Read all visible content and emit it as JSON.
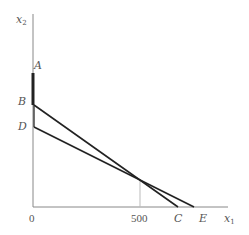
{
  "diagram": {
    "axes": {
      "y_label": "x",
      "y_label_sub": "2",
      "x_label": "x",
      "x_label_sub": "1",
      "origin_label": "0"
    },
    "points": {
      "A": "A",
      "B": "B",
      "C": "C",
      "D": "D",
      "E": "E"
    },
    "ticks": {
      "x_500": "500"
    },
    "lines": [
      {
        "name": "AB",
        "from": "A",
        "to": "B",
        "style": "thick"
      },
      {
        "name": "BC",
        "from": "B",
        "to": "C",
        "style": "normal"
      },
      {
        "name": "DE",
        "from": "D",
        "to": "E",
        "style": "normal"
      },
      {
        "name": "500-guide",
        "from": "(500,0)",
        "to": "intersection",
        "style": "thin-gray"
      }
    ],
    "colors": {
      "axis": "#888888",
      "line": "#222222",
      "guide": "#bbbbbb",
      "text": "#555555"
    }
  }
}
